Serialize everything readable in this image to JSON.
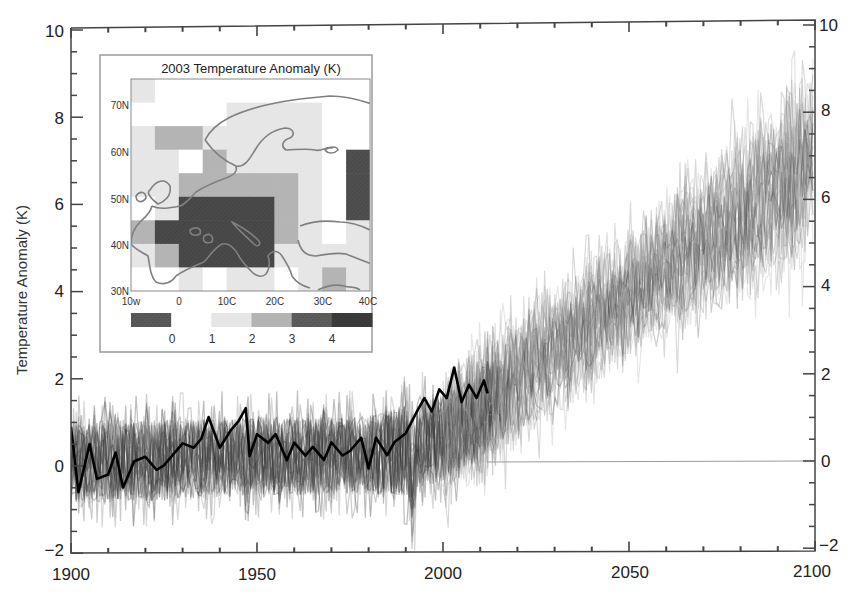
{
  "chart_data": [
    {
      "type": "line",
      "title": "",
      "xlabel": "",
      "ylabel": "Temperature Anomaly (K)",
      "xlim": [
        1900,
        2100
      ],
      "ylim": [
        -2,
        10
      ],
      "x_ticks": [
        1900,
        1950,
        2000,
        2050,
        2100
      ],
      "y_ticks": [
        -2,
        0,
        2,
        4,
        6,
        8,
        10
      ],
      "y_ticks_right": [
        -2,
        0,
        2,
        4,
        6,
        8,
        10
      ],
      "x_minor_tick_step": 10,
      "y_minor_tick_step": 0.5,
      "grid": false,
      "legend": null,
      "annotations": [
        "horizontal reference line at 0 K from ~2012 to 2100"
      ],
      "series": [
        {
          "name": "Observed summer temperature anomaly (black line)",
          "color": "#000000",
          "x": [
            1900,
            1902,
            1905,
            1907,
            1910,
            1912,
            1914,
            1917,
            1920,
            1923,
            1925,
            1928,
            1930,
            1933,
            1935,
            1937,
            1940,
            1943,
            1945,
            1947,
            1948,
            1950,
            1953,
            1955,
            1958,
            1960,
            1963,
            1965,
            1968,
            1970,
            1973,
            1975,
            1978,
            1980,
            1982,
            1985,
            1987,
            1990,
            1993,
            1995,
            1997,
            1999,
            2001,
            2003,
            2005,
            2007,
            2009,
            2011,
            2012
          ],
          "values": [
            0.9,
            -0.6,
            0.5,
            -0.3,
            -0.2,
            0.3,
            -0.5,
            0.1,
            0.2,
            -0.1,
            0.0,
            0.3,
            0.5,
            0.4,
            0.6,
            1.1,
            0.4,
            0.8,
            1.0,
            1.3,
            0.2,
            0.7,
            0.5,
            0.7,
            0.1,
            0.5,
            0.2,
            0.4,
            0.1,
            0.5,
            0.2,
            0.3,
            0.6,
            -0.1,
            0.6,
            0.2,
            0.5,
            0.7,
            1.2,
            1.5,
            1.2,
            1.7,
            1.5,
            2.2,
            1.4,
            1.8,
            1.5,
            1.9,
            1.6
          ]
        },
        {
          "name": "Model ensemble (gray traces) - envelope",
          "color": "#555555",
          "x": [
            1900,
            1920,
            1950,
            1980,
            1990,
            2000,
            2012,
            2030,
            2050,
            2070,
            2090,
            2100
          ],
          "lower": [
            -1.6,
            -1.4,
            -1.2,
            -1.2,
            -1.6,
            -0.9,
            -0.6,
            1.0,
            2.4,
            3.6,
            4.4,
            5.0
          ],
          "center": [
            0.1,
            0.1,
            0.2,
            0.2,
            0.3,
            0.6,
            1.3,
            2.6,
            3.8,
            5.0,
            6.2,
            6.9
          ],
          "upper": [
            1.5,
            1.7,
            1.8,
            1.8,
            1.9,
            2.4,
            3.0,
            4.5,
            5.8,
            7.6,
            9.2,
            10.0
          ]
        }
      ]
    },
    {
      "type": "heatmap",
      "title": "2003 Temperature Anomaly (K)",
      "xlabel": "Longitude",
      "ylabel": "Latitude",
      "x_ticks": [
        "10w",
        "0",
        "10C",
        "20C",
        "30C",
        "40C"
      ],
      "y_ticks": [
        "30N",
        "40N",
        "50N",
        "60N",
        "70N"
      ],
      "lon_range": [
        -10,
        40
      ],
      "lat_range": [
        30,
        75
      ],
      "cell_size_deg": 5,
      "colorbar": {
        "ticks": [
          "0",
          "1",
          "2",
          "3",
          "4"
        ],
        "colors": [
          "#5a5a5a",
          "#ffffff",
          "#e6e6e6",
          "#b4b4b4",
          "#5e5e5e",
          "#3c3c3c"
        ]
      },
      "grid_rows_top_to_bottom_lat": [
        75,
        70,
        65,
        60,
        55,
        50,
        45,
        40,
        35
      ],
      "grid_cols_left_to_right_lon": [
        -10,
        -5,
        0,
        5,
        10,
        15,
        20,
        25,
        30,
        35
      ],
      "values_class": [
        [
          2,
          1,
          1,
          1,
          1,
          1,
          1,
          1,
          1,
          1
        ],
        [
          1,
          1,
          1,
          1,
          2,
          2,
          2,
          2,
          1,
          1
        ],
        [
          2,
          3,
          3,
          2,
          2,
          2,
          2,
          2,
          1,
          1
        ],
        [
          2,
          2,
          1,
          3,
          2,
          2,
          2,
          2,
          1,
          5
        ],
        [
          2,
          2,
          3,
          3,
          3,
          3,
          3,
          2,
          1,
          5
        ],
        [
          1,
          2,
          4,
          4,
          4,
          4,
          3,
          2,
          1,
          5
        ],
        [
          3,
          4,
          4,
          4,
          4,
          4,
          3,
          2,
          1,
          2
        ],
        [
          2,
          3,
          4,
          4,
          4,
          4,
          2,
          2,
          2,
          2
        ],
        [
          1,
          1,
          2,
          1,
          2,
          2,
          1,
          2,
          3,
          2
        ]
      ]
    }
  ],
  "main_axis": {
    "ylabel": "Temperature Anomaly (K)",
    "x_tick_labels": [
      "1900",
      "1950",
      "2000",
      "2050",
      "2100"
    ],
    "y_tick_labels_left": [
      "−2",
      "0",
      "2",
      "4",
      "6",
      "8",
      "10"
    ],
    "y_tick_labels_right": [
      "−2",
      "0",
      "2",
      "4",
      "6",
      "8",
      "10"
    ]
  },
  "inset": {
    "title": "2003 Temperature Anomaly (K)",
    "lat_labels": [
      "70N",
      "60N",
      "50N",
      "40N",
      "30N"
    ],
    "lon_labels": [
      "10w",
      "0",
      "10C",
      "20C",
      "30C",
      "40C"
    ],
    "colorbar_labels": [
      "0",
      "1",
      "2",
      "3",
      "4"
    ]
  }
}
